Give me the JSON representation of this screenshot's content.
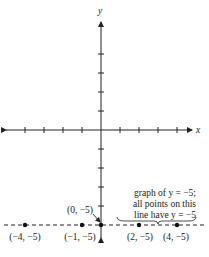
{
  "chart_data": {
    "type": "line",
    "title": "",
    "xlabel": "x",
    "ylabel": "y",
    "xlim": [
      -5,
      5
    ],
    "ylim": [
      -6,
      5
    ],
    "x_ticks": [
      -4,
      -3,
      -2,
      -1,
      1,
      2,
      3,
      4
    ],
    "y_ticks": [
      -4,
      -3,
      -2,
      -1,
      1,
      2,
      3,
      4
    ],
    "series": [
      {
        "name": "y = -5",
        "style": "dashed",
        "equation": "y = -5"
      }
    ],
    "points": [
      {
        "x": -4,
        "y": -5,
        "label": "(−4, −5)"
      },
      {
        "x": -1,
        "y": -5,
        "label": "(−1, −5)"
      },
      {
        "x": 0,
        "y": -5,
        "label": "(0, −5)"
      },
      {
        "x": 2,
        "y": -5,
        "label": "(2, −5)"
      },
      {
        "x": 4,
        "y": -5,
        "label": "(4, −5)"
      }
    ],
    "annotation": {
      "lines": [
        "graph of y = −5;",
        "all points on this",
        "line have y = −5"
      ]
    }
  },
  "axis_labels": {
    "x": "x",
    "y": "y"
  }
}
